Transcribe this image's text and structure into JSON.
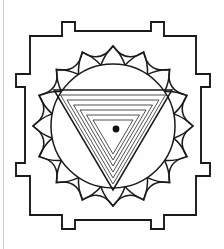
{
  "figure": {
    "type": "line-drawing",
    "background_color": "#fefefe",
    "ink_color": "#1a1a1a",
    "canvas": {
      "width": 224,
      "height": 249
    }
  },
  "geometry": {
    "page_edge": {
      "x": 3.5,
      "y1": 0,
      "y2": 249,
      "color": "#cfcfcf"
    },
    "bhupura": {
      "label": "outer-square-frame",
      "left": 30,
      "top": 36,
      "right": 196,
      "bottom": 215,
      "stroke_width": 1.9
    },
    "gates": [
      {
        "name": "north-gate",
        "side": "top",
        "outer_span": [
          62,
          164
        ],
        "outer_offset": 14,
        "inner_span": [
          75,
          151
        ],
        "notch_depth": 9
      },
      {
        "name": "south-gate",
        "side": "bottom",
        "outer_span": [
          62,
          164
        ],
        "outer_offset": 14,
        "inner_span": [
          75,
          151
        ],
        "notch_depth": 9
      },
      {
        "name": "west-gate",
        "side": "left",
        "outer_span": [
          74,
          176
        ],
        "outer_offset": 14,
        "inner_span": [
          87,
          163
        ],
        "notch_depth": 9
      },
      {
        "name": "east-gate",
        "side": "right",
        "outer_span": [
          74,
          176
        ],
        "outer_offset": 14,
        "inner_span": [
          87,
          163
        ],
        "notch_depth": 9
      }
    ],
    "lotus": {
      "name": "sixteen-petal-lotus",
      "petal_count": 16,
      "center": [
        113,
        126
      ],
      "inner_radius": 62,
      "outer_radius": 80
    },
    "circle": {
      "name": "inner-circle",
      "center": [
        113,
        126
      ],
      "radius": 62,
      "stroke_width": 1.5
    },
    "triangles": {
      "name": "nested-downward-triangles",
      "count": 7,
      "orientation": "downward",
      "apex_x": 113,
      "outermost": {
        "top_y": 90,
        "left_x": 54,
        "right_x": 172,
        "apex_y": 190
      },
      "step": 8
    },
    "bindu": {
      "name": "center-bindu-dot",
      "center": [
        116,
        129
      ],
      "radius": 3.4,
      "color": "#111111"
    }
  }
}
